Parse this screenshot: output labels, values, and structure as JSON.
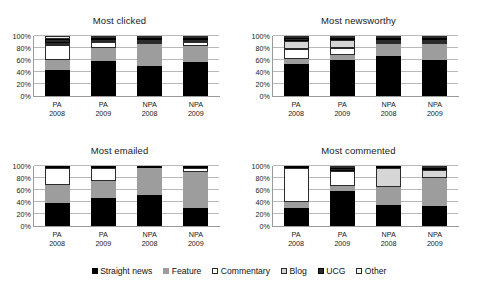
{
  "legend": {
    "position": "bottom-center",
    "items": [
      {
        "label": "Straight news",
        "color": "#000000",
        "border": "#000000"
      },
      {
        "label": "Feature",
        "color": "#9d9d9d",
        "border": "#9d9d9d"
      },
      {
        "label": "Commentary",
        "color": "#ffffff",
        "border": "#2b2b2b"
      },
      {
        "label": "Blog",
        "color": "#d6d6d6",
        "border": "#2b2b2b"
      },
      {
        "label": "UCG",
        "color": "#2b2b2b",
        "border": "#000000"
      },
      {
        "label": "Other",
        "color": "#f2f2f2",
        "border": "#2b2b2b"
      }
    ]
  },
  "axis": {
    "tick_labels": [
      "0%",
      "20%",
      "40%",
      "60%",
      "80%",
      "100%"
    ],
    "ticks": [
      0,
      20,
      40,
      60,
      80,
      100
    ],
    "ylim": [
      0,
      100
    ]
  },
  "categories": [
    {
      "line1": "PA",
      "line2": "2008"
    },
    {
      "line1": "PA",
      "line2": "2009"
    },
    {
      "line1": "NPA",
      "line2": "2008"
    },
    {
      "line1": "NPA",
      "line2": "2009"
    }
  ],
  "chart_data": [
    {
      "type": "bar",
      "title": "Most clicked",
      "stacked": true,
      "xlabel": "",
      "ylabel": "",
      "ylim": [
        0,
        100
      ],
      "grid": true,
      "categories": [
        "PA 2008",
        "PA 2009",
        "NPA 2008",
        "NPA 2009"
      ],
      "series": [
        {
          "name": "Straight news",
          "values": [
            44,
            60,
            52,
            58
          ]
        },
        {
          "name": "Feature",
          "values": [
            16,
            22,
            36,
            27
          ]
        },
        {
          "name": "Commentary",
          "values": [
            25,
            10,
            4,
            7
          ]
        },
        {
          "name": "Blog",
          "values": [
            4,
            3,
            3,
            3
          ]
        },
        {
          "name": "UCG",
          "values": [
            6,
            3,
            3,
            3
          ]
        },
        {
          "name": "Other",
          "values": [
            5,
            2,
            2,
            2
          ]
        }
      ]
    },
    {
      "type": "bar",
      "title": "Most newsworthy",
      "stacked": true,
      "xlabel": "",
      "ylabel": "",
      "ylim": [
        0,
        100
      ],
      "grid": true,
      "categories": [
        "PA 2008",
        "PA 2009",
        "NPA 2008",
        "NPA 2009"
      ],
      "series": [
        {
          "name": "Straight news",
          "values": [
            53,
            60,
            71,
            60
          ]
        },
        {
          "name": "Feature",
          "values": [
            9,
            9,
            22,
            27
          ]
        },
        {
          "name": "Commentary",
          "values": [
            16,
            12,
            1,
            3
          ]
        },
        {
          "name": "Blog",
          "values": [
            14,
            13,
            2,
            4
          ]
        },
        {
          "name": "UCG",
          "values": [
            4,
            3,
            2,
            3
          ]
        },
        {
          "name": "Other",
          "values": [
            4,
            3,
            2,
            3
          ]
        }
      ]
    },
    {
      "type": "bar",
      "title": "Most emailed",
      "stacked": true,
      "xlabel": "",
      "ylabel": "",
      "ylim": [
        0,
        100
      ],
      "grid": true,
      "categories": [
        "PA 2008",
        "PA 2009",
        "NPA 2008",
        "NPA 2009"
      ],
      "series": [
        {
          "name": "Straight news",
          "values": [
            39,
            46,
            52,
            30
          ]
        },
        {
          "name": "Feature",
          "values": [
            29,
            29,
            45,
            60
          ]
        },
        {
          "name": "Commentary",
          "values": [
            29,
            22,
            0,
            7
          ]
        },
        {
          "name": "Blog",
          "values": [
            0,
            0,
            0,
            0
          ]
        },
        {
          "name": "UCG",
          "values": [
            3,
            3,
            3,
            3
          ]
        },
        {
          "name": "Other",
          "values": [
            0,
            0,
            0,
            0
          ]
        }
      ]
    },
    {
      "type": "bar",
      "title": "Most commented",
      "stacked": true,
      "xlabel": "",
      "ylabel": "",
      "ylim": [
        0,
        100
      ],
      "grid": true,
      "categories": [
        "PA 2008",
        "PA 2009",
        "NPA 2008",
        "NPA 2009"
      ],
      "series": [
        {
          "name": "Straight news",
          "values": [
            30,
            58,
            35,
            34
          ]
        },
        {
          "name": "Feature",
          "values": [
            10,
            8,
            31,
            48
          ]
        },
        {
          "name": "Commentary",
          "values": [
            56,
            26,
            0,
            0
          ]
        },
        {
          "name": "Blog",
          "values": [
            0,
            0,
            32,
            13
          ]
        },
        {
          "name": "UCG",
          "values": [
            4,
            4,
            2,
            2
          ]
        },
        {
          "name": "Other",
          "values": [
            0,
            4,
            0,
            3
          ]
        }
      ]
    }
  ]
}
